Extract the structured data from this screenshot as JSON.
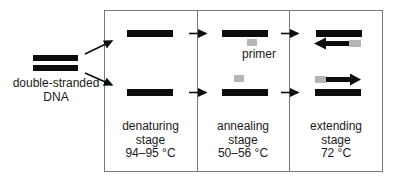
{
  "diagram": {
    "dna_label": {
      "line1": "double-stranded",
      "line2": "DNA"
    },
    "primer_label": "primer",
    "stages": [
      {
        "name": "denaturing",
        "stage_word": "stage",
        "temperature": "94–95 °C"
      },
      {
        "name": "annealing",
        "stage_word": "stage",
        "temperature": "50–56 °C"
      },
      {
        "name": "extending",
        "stage_word": "stage",
        "temperature": "72 °C"
      }
    ],
    "colors": {
      "strand": "#0d0d0d",
      "primer": "#b5b5b5",
      "box_border": "#777777",
      "text": "#1a1a1a",
      "background": "#ffffff"
    }
  }
}
